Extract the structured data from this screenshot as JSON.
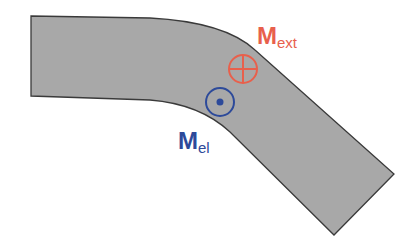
{
  "diagram": {
    "beam": {
      "fill": "#a8a8a8",
      "stroke": "#3a3a3a"
    },
    "labels": {
      "external_moment": {
        "main": "M",
        "sub": "ext",
        "color": "#e8604c"
      },
      "elastic_moment": {
        "main": "M",
        "sub": "el",
        "color": "#2d4a9a"
      }
    },
    "symbols": {
      "into_page": {
        "name": "cross-in-circle",
        "color": "#e8604c"
      },
      "out_of_page": {
        "name": "dot-in-circle",
        "color": "#2d4a9a"
      }
    }
  }
}
